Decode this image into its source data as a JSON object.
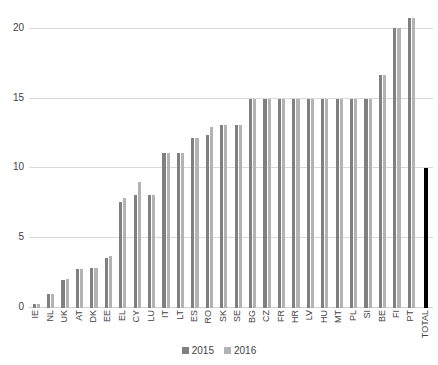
{
  "chart_data": {
    "type": "bar",
    "title": "",
    "subtitle": "",
    "xlabel": "",
    "ylabel": "",
    "ylim": [
      0,
      21.5
    ],
    "yticks": [
      0,
      5,
      10,
      15,
      20
    ],
    "ytick_labels": [
      "0",
      "5",
      "10",
      "15",
      "20"
    ],
    "grid": true,
    "legend_position": "bottom",
    "categories": [
      "IE",
      "NL",
      "UK",
      "AT",
      "DK",
      "EE",
      "EL",
      "CY",
      "LU",
      "IT",
      "LT",
      "ES",
      "RO",
      "SK",
      "SE",
      "BG",
      "CZ",
      "FR",
      "HR",
      "LV",
      "HU",
      "MT",
      "PL",
      "SI",
      "BE",
      "FI",
      "PT",
      "TOTAL"
    ],
    "series": [
      {
        "name": "2015",
        "color": "#808080",
        "values": [
          0.3,
          1.0,
          2.0,
          2.8,
          2.9,
          3.6,
          7.6,
          8.1,
          8.1,
          11.1,
          11.1,
          12.2,
          12.4,
          13.1,
          13.1,
          15.0,
          15.0,
          15.0,
          15.0,
          15.0,
          15.0,
          15.0,
          15.0,
          15.0,
          16.7,
          20.1,
          20.8,
          null
        ]
      },
      {
        "name": "2016",
        "color": "#b3b3b3",
        "values": [
          0.3,
          1.0,
          2.1,
          2.8,
          2.9,
          3.7,
          7.9,
          9.0,
          8.1,
          11.1,
          11.1,
          12.2,
          13.0,
          13.1,
          13.1,
          15.0,
          15.0,
          15.0,
          15.0,
          15.0,
          15.0,
          15.0,
          15.0,
          15.0,
          16.7,
          20.1,
          20.8,
          null
        ]
      },
      {
        "name": "TOTAL",
        "color": "#000000",
        "values": [
          null,
          null,
          null,
          null,
          null,
          null,
          null,
          null,
          null,
          null,
          null,
          null,
          null,
          null,
          null,
          null,
          null,
          null,
          null,
          null,
          null,
          null,
          null,
          null,
          null,
          null,
          null,
          10.0
        ]
      }
    ]
  },
  "legend": {
    "items": [
      {
        "label": "2015",
        "color": "#808080"
      },
      {
        "label": "2016",
        "color": "#b3b3b3"
      }
    ]
  }
}
